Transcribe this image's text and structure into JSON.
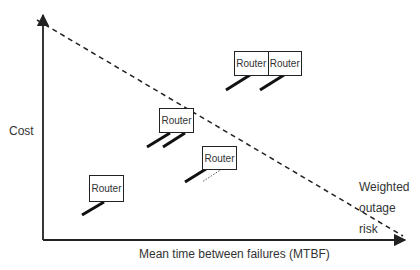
{
  "diagram": {
    "y_axis_label": "Cost",
    "x_axis_label": "Mean time between failures (MTBF)",
    "trend_line_label": [
      "Weighted",
      "outage",
      "risk"
    ],
    "router_label": "Router",
    "nodes": [
      {
        "id": "router-low-cost-low-mtbf",
        "labels": [
          "Router"
        ],
        "links": 1
      },
      {
        "id": "router-mid-redundant",
        "labels": [
          "Router"
        ],
        "links": 2
      },
      {
        "id": "router-mid-partial",
        "labels": [
          "Router"
        ],
        "links": 1,
        "dotted_links": 1
      },
      {
        "id": "router-pair-high-cost",
        "labels": [
          "Router",
          "Router"
        ],
        "links": 2
      }
    ],
    "colors": {
      "line": "#222222",
      "text": "#333333",
      "background": "#ffffff"
    }
  }
}
